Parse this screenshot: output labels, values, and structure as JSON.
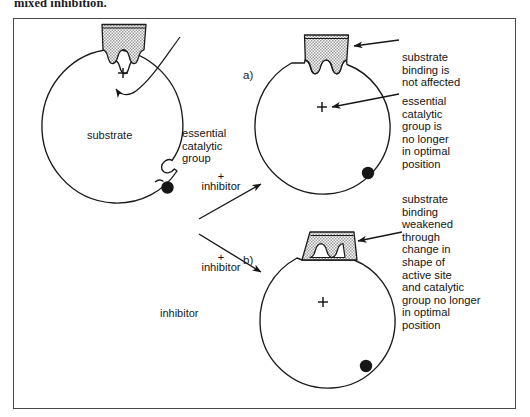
{
  "figure": {
    "caption_top": "mixed inhibition.",
    "frame": {
      "border_color": "#4a4a4a",
      "background": "#ffffff"
    }
  },
  "colors": {
    "ink": "#141414",
    "enzyme_outline": "#1a1a1a",
    "substrate_fill": "#b9b9b9",
    "inhibitor_fill": "#161616",
    "frame_border": "#4a4a4a"
  },
  "enzyme_free": {
    "substrate_label": "substrate",
    "catalytic_group_label": "essential\ncatalytic\ngroup",
    "catalytic_group_symbol": "+",
    "inhibitor_label": "inhibitor"
  },
  "transitions": [
    {
      "id": "to-a",
      "plus": "+",
      "label": "inhibitor"
    },
    {
      "id": "to-b",
      "plus": "+",
      "label": "inhibitor"
    }
  ],
  "panels": [
    {
      "id": "a",
      "letter": "a)",
      "catalytic_group_symbol": "+",
      "annotations": [
        {
          "name": "substrate-binding-note",
          "text": "substrate\nbinding is\nnot affected"
        },
        {
          "name": "catalytic-group-note",
          "text": "essential\ncatalytic\ngroup is\nno longer\nin optimal\nposition"
        }
      ]
    },
    {
      "id": "b",
      "letter": "b)",
      "catalytic_group_symbol": "+",
      "annotations": [
        {
          "name": "substrate-binding-note",
          "text": "substrate\nbinding\nweakened\nthrough\nchange in\nshape of\nactive site\nand catalytic\ngroup no longer\nin optimal\nposition"
        }
      ]
    }
  ]
}
